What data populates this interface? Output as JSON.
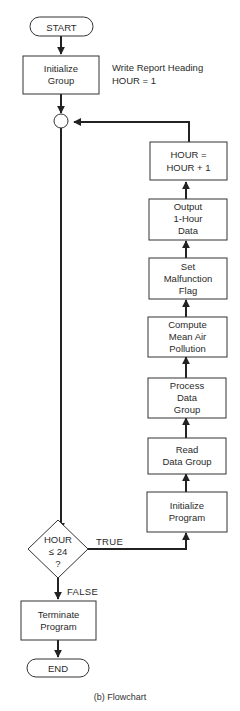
{
  "diagram": {
    "type": "flowchart",
    "caption": "(b) Flowchart",
    "nodes": {
      "start": {
        "shape": "terminal",
        "lines": [
          "START"
        ]
      },
      "init_group": {
        "shape": "process",
        "lines": [
          "Initialize",
          "Group"
        ]
      },
      "connector": {
        "shape": "connector"
      },
      "hour_incr": {
        "shape": "process",
        "lines": [
          "HOUR =",
          "HOUR + 1"
        ]
      },
      "output": {
        "shape": "process",
        "lines": [
          "Output",
          "1-Hour",
          "Data"
        ]
      },
      "set_flag": {
        "shape": "process",
        "lines": [
          "Set",
          "Malfunction",
          "Flag"
        ]
      },
      "compute": {
        "shape": "process",
        "lines": [
          "Compute",
          "Mean Air",
          "Pollution"
        ]
      },
      "process": {
        "shape": "process",
        "lines": [
          "Process",
          "Data",
          "Group"
        ]
      },
      "read": {
        "shape": "process",
        "lines": [
          "Read",
          "Data Group"
        ]
      },
      "init_program": {
        "shape": "process",
        "lines": [
          "Initialize",
          "Program"
        ]
      },
      "decision": {
        "shape": "decision",
        "lines": [
          "HOUR",
          "≤ 24",
          "?"
        ]
      },
      "terminate": {
        "shape": "process",
        "lines": [
          "Terminate",
          "Program"
        ]
      },
      "end": {
        "shape": "terminal",
        "lines": [
          "END"
        ]
      }
    },
    "annotations": {
      "init_note": [
        "Write Report Heading",
        "HOUR = 1"
      ]
    },
    "edge_labels": {
      "true": "TRUE",
      "false": "FALSE"
    },
    "edges": [
      [
        "start",
        "init_group"
      ],
      [
        "init_group",
        "connector"
      ],
      [
        "connector",
        "decision"
      ],
      [
        "decision",
        "init_program",
        "TRUE"
      ],
      [
        "decision",
        "terminate",
        "FALSE"
      ],
      [
        "init_program",
        "read"
      ],
      [
        "read",
        "process"
      ],
      [
        "process",
        "compute"
      ],
      [
        "compute",
        "set_flag"
      ],
      [
        "set_flag",
        "output"
      ],
      [
        "output",
        "hour_incr"
      ],
      [
        "hour_incr",
        "connector"
      ],
      [
        "terminate",
        "end"
      ]
    ]
  }
}
